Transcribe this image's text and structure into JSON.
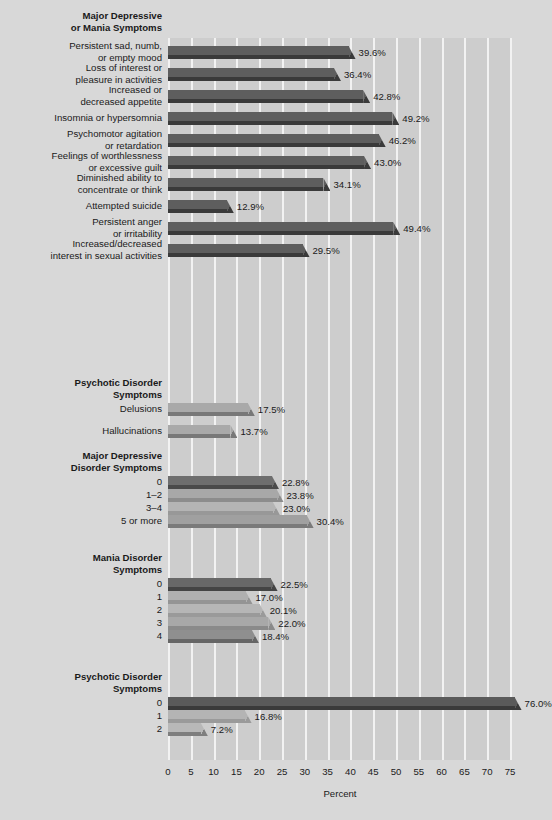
{
  "chart_data": {
    "type": "bar",
    "orientation": "horizontal",
    "title": "",
    "xlabel": "Percent",
    "ylabel": "",
    "xlim": [
      0,
      76.5
    ],
    "xticks": [
      0,
      5,
      10,
      15,
      20,
      25,
      30,
      35,
      40,
      45,
      50,
      55,
      60,
      65,
      70,
      75
    ],
    "grid": "vertical",
    "legend": "none",
    "value_suffix": "%",
    "groups": [
      {
        "name": "Major Depressive or Mania Symptoms",
        "heading": "Major Depressive\nor Mania Symptoms",
        "bar_color": "#5e5e5e",
        "shadow_color": "#3a3a3a",
        "categories": [
          "Persistent sad, numb,\nor empty mood",
          "Loss of interest or\npleasure in activities",
          "Increased or\ndecreased appetite",
          "Insomnia or hypersomnia",
          "Psychomotor agitation\nor retardation",
          "Feelings of worthlessness\nor excessive guilt",
          "Diminished ability to\nconcentrate or think",
          "Attempted suicide",
          "Persistent anger\nor irritability",
          "Increased/decreased\ninterest in sexual activities"
        ],
        "values": [
          39.6,
          36.4,
          42.8,
          49.2,
          46.2,
          43.0,
          34.1,
          12.9,
          49.4,
          29.5
        ],
        "labels": [
          "39.6%",
          "36.4%",
          "42.8%",
          "49.2%",
          "46.2%",
          "43.0%",
          "34.1%",
          "12.9%",
          "49.4%",
          "29.5%"
        ]
      },
      {
        "name": "Psychotic Disorder Symptoms",
        "heading": "Psychotic Disorder\nSymptoms",
        "bar_color": "#a9a9a9",
        "shadow_color": "#787878",
        "categories": [
          "Delusions",
          "Hallucinations"
        ],
        "values": [
          17.5,
          13.7
        ],
        "labels": [
          "17.5%",
          "13.7%"
        ]
      },
      {
        "name": "Major Depressive Disorder Symptoms",
        "heading": "Major Depressive\nDisorder Symptoms",
        "categories": [
          "0",
          "1–2",
          "3–4",
          "5 or more"
        ],
        "values": [
          22.8,
          23.8,
          23.0,
          30.4
        ],
        "labels": [
          "22.8%",
          "23.8%",
          "23.0%",
          "30.4%"
        ],
        "bar_colors": [
          "#6e6e6e",
          "#a8a8a8",
          "#b4b4b4",
          "#a0a0a0"
        ],
        "shadow_colors": [
          "#4a4a4a",
          "#8c8c8c",
          "#989898",
          "#7a7a7a"
        ],
        "stacked_rows": true
      },
      {
        "name": "Mania Disorder Symptoms",
        "heading": "Mania Disorder\nSymptoms",
        "categories": [
          "0",
          "1",
          "2",
          "3",
          "4"
        ],
        "values": [
          22.5,
          17.0,
          20.1,
          22.0,
          18.4
        ],
        "labels": [
          "22.5%",
          "17.0%",
          "20.1%",
          "22.0%",
          "18.4%"
        ],
        "bar_colors": [
          "#686868",
          "#b0b0b0",
          "#b6b6b6",
          "#a8a8a8",
          "#8f8f8f"
        ],
        "shadow_colors": [
          "#444444",
          "#949494",
          "#9a9a9a",
          "#8a8a8a",
          "#666666"
        ],
        "stacked_rows": true
      },
      {
        "name": "Psychotic Disorder Symptoms (count)",
        "heading": "Psychotic Disorder\nSymptoms",
        "categories": [
          "0",
          "1",
          "2"
        ],
        "values": [
          76.0,
          16.8,
          7.2
        ],
        "labels": [
          "76.0%",
          "16.8%",
          "7.2%"
        ],
        "bar_colors": [
          "#5a5a5a",
          "#b4b4b4",
          "#b8b8b8"
        ],
        "shadow_colors": [
          "#3a3a3a",
          "#9a9a9a",
          "#7e7e7e"
        ],
        "stacked_rows": true
      }
    ]
  },
  "axis": {
    "x_title": "Percent",
    "tick_labels": [
      "0",
      "5",
      "10",
      "15",
      "20",
      "25",
      "30",
      "35",
      "40",
      "45",
      "50",
      "55",
      "60",
      "65",
      "70",
      "75"
    ]
  },
  "colors": {
    "page_background": "#d8d8d8",
    "plot_background": "#cdcdcd",
    "gridline": "#f2f2f2",
    "text": "#1a1a1a"
  }
}
